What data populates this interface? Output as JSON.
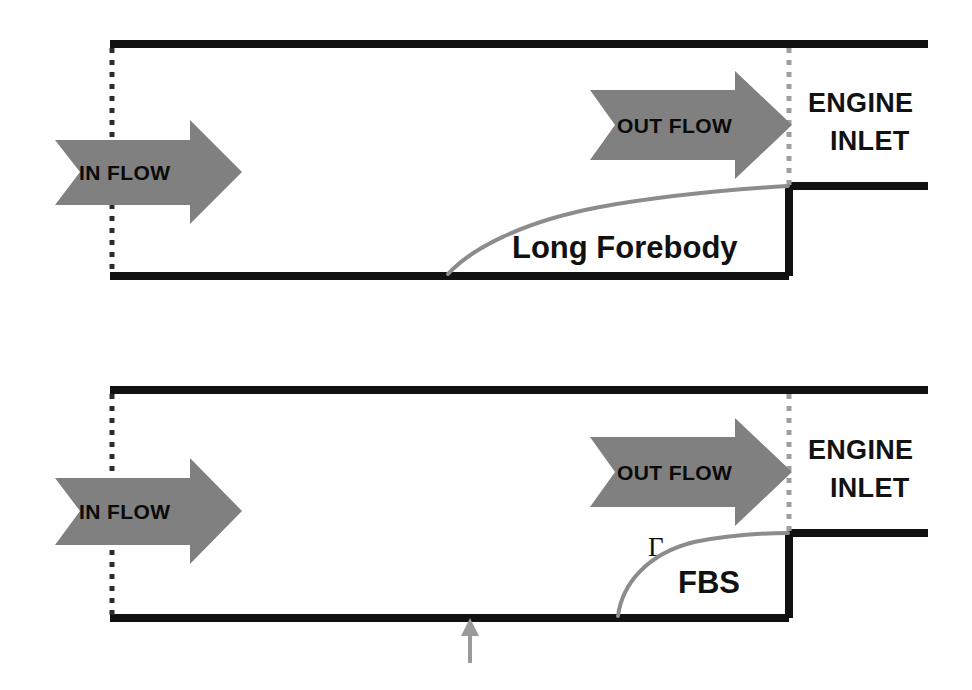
{
  "figure": {
    "type": "schematic-diagram",
    "title_visible": false,
    "background_color": "#ffffff",
    "wall_color": "#111111",
    "arrow_fill_color": "#808080",
    "curve_color": "#8c8c8c",
    "dotted_line_color": "#2b2b2b",
    "pointer_color": "#9a9a9a"
  },
  "panels": [
    {
      "id": "top-panel",
      "name": "long-forebody-configuration",
      "body_label": "Long Forebody",
      "inflow_label": "IN FLOW",
      "outflow_label": "OUT FLOW",
      "engine_label_line1": "ENGINE",
      "engine_label_line2": "INLET",
      "gamma_label": "",
      "has_gamma": false,
      "has_ground_pointer": false,
      "geometry": {
        "duct_left_x": 110,
        "duct_right_x": 928,
        "top_wall_y": 44,
        "bottom_wall_y": 276,
        "step_x": 789,
        "step_top_y": 186,
        "forebody_start_x": 448,
        "inlet_dotted_x": 789
      }
    },
    {
      "id": "bottom-panel",
      "name": "fbs-configuration",
      "body_label": "FBS",
      "inflow_label": "IN FLOW",
      "outflow_label": "OUT FLOW",
      "engine_label_line1": "ENGINE",
      "engine_label_line2": "INLET",
      "gamma_label": "Γ",
      "has_gamma": true,
      "has_ground_pointer": true,
      "geometry": {
        "duct_left_x": 110,
        "duct_right_x": 928,
        "top_wall_y": 390,
        "bottom_wall_y": 618,
        "step_x": 789,
        "step_top_y": 533,
        "forebody_start_x": 618,
        "inlet_dotted_x": 789,
        "ground_pointer_x": 470,
        "ground_pointer_bottom_y": 663
      }
    }
  ],
  "icons": {
    "inflow_arrow": "right-arrow-icon",
    "outflow_arrow": "right-arrow-icon",
    "ground_pointer": "up-arrow-icon"
  }
}
